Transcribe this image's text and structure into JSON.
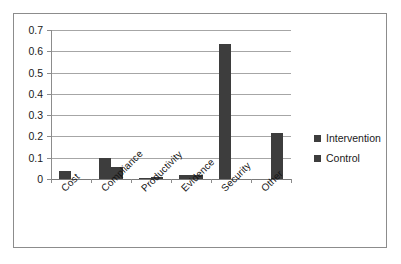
{
  "chart_data": {
    "type": "bar",
    "title": "",
    "xlabel": "",
    "ylabel": "",
    "ylim": [
      0,
      0.7
    ],
    "grid": true,
    "legend_position": "right",
    "categories": [
      "Cost",
      "Compliance",
      "Productivity",
      "Evidence",
      "Security",
      "Other"
    ],
    "ytick_labels": [
      "0.7",
      "0.6",
      "0.5",
      "0.4",
      "0.3",
      "0.2",
      "0.1",
      "0"
    ],
    "ytick_values": [
      0.7,
      0.6,
      0.5,
      0.4,
      0.3,
      0.2,
      0.1,
      0
    ],
    "series": [
      {
        "name": "Intervention",
        "color": "#3d3d3d",
        "values": [
          0.04,
          0.1,
          0.003,
          0.018,
          0.635,
          0.0
        ]
      },
      {
        "name": "Control",
        "color": "#3d3d3d",
        "values": [
          0.0,
          0.055,
          0.01,
          0.02,
          0.0,
          0.215
        ]
      }
    ]
  },
  "legend": {
    "items": [
      {
        "label": "Intervention",
        "color": "#3d3d3d"
      },
      {
        "label": "Control",
        "color": "#3d3d3d"
      }
    ]
  },
  "colors": {
    "bar": "#3d3d3d",
    "grid": "#a6a6a6",
    "axis": "#8c8c8c",
    "frame": "#8c8c8c",
    "background": "#ffffff",
    "text": "#1a1a1a"
  }
}
